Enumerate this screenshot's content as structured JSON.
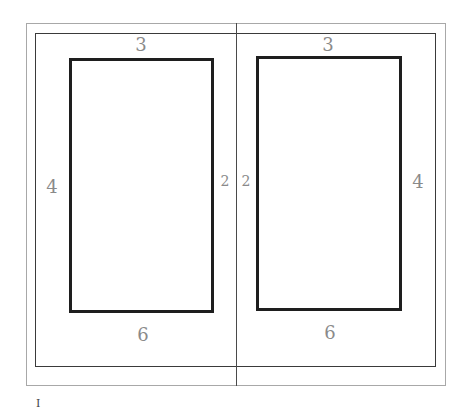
{
  "diagram": {
    "left_page": {
      "margins": {
        "top": "3",
        "outer": "4",
        "inner": "2",
        "bottom": "6"
      }
    },
    "right_page": {
      "margins": {
        "top": "3",
        "inner": "2",
        "outer": "4",
        "bottom": "6"
      }
    },
    "page_number": "I",
    "colors": {
      "outer_border": "#a8a8a8",
      "inner_border": "#3a3a3a",
      "text_block": "#1e1e1e",
      "labels": "#8a8a8a"
    }
  }
}
